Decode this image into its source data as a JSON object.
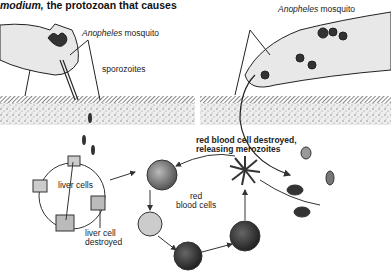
{
  "title": {
    "italic_part": "modium,",
    "rest": " the protozoan that causes"
  },
  "labels": {
    "left_mosquito_italic": "Anopheles",
    "left_mosquito_rest": " mosquito",
    "right_mosquito_italic": "Anopheles",
    "right_mosquito_rest": " mosquito",
    "sporozoites": "sporozoites",
    "rbc_destroyed_line1": "red blood cell destroyed,",
    "rbc_destroyed_line2": "releasing merozoites",
    "liver_cells": "liver cells",
    "liver_cell_destroyed_line1": "liver cell",
    "liver_cell_destroyed_line2": "destroyed",
    "red_blood_cells_line1": "red",
    "red_blood_cells_line2": "blood cells"
  },
  "colors": {
    "ink": "#222222",
    "skin_band": "#555555",
    "tissue": "#d8d8d8",
    "mosquito_fill": "#e8e8e8"
  }
}
